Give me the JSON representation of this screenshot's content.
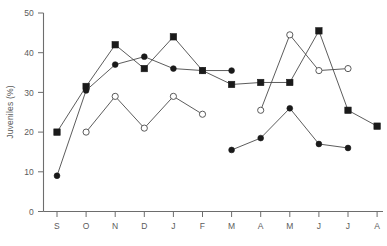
{
  "chart_data": {
    "type": "line",
    "title": "",
    "xlabel": "",
    "ylabel": "Juveniles (%)",
    "categories": [
      "S",
      "O",
      "N",
      "D",
      "J",
      "F",
      "M",
      "A",
      "M",
      "J",
      "J",
      "A"
    ],
    "ylim": [
      0,
      50
    ],
    "yticks": [
      0,
      10,
      20,
      30,
      40,
      50
    ],
    "ytick_labels": [
      "0",
      "10",
      "20",
      "30",
      "40",
      "50"
    ],
    "grid": false,
    "legend": "none",
    "series": [
      {
        "name": "filled-square",
        "marker": "filled square",
        "values": [
          20,
          31.5,
          42,
          36,
          44,
          35.5,
          32,
          32.5,
          32.5,
          45.5,
          25.5,
          21.5
        ]
      },
      {
        "name": "filled-circle",
        "marker": "filled circle",
        "values": [
          9,
          30.5,
          37,
          39,
          36,
          35.5,
          35.5,
          null,
          null,
          null,
          null,
          null
        ]
      },
      {
        "name": "filled-circle-lower",
        "marker": "filled circle",
        "values": [
          null,
          null,
          null,
          null,
          null,
          null,
          15.5,
          18.5,
          26,
          17,
          16,
          null
        ]
      },
      {
        "name": "open-circle",
        "marker": "open circle",
        "values": [
          null,
          20,
          29,
          21,
          29,
          24.5,
          null,
          25.5,
          44.5,
          35.5,
          36,
          null
        ]
      }
    ]
  },
  "axis": {
    "y_title": "Juveniles (%)",
    "y_ticks": [
      "50",
      "40",
      "30",
      "20",
      "10",
      "0"
    ],
    "x_ticks": [
      "S",
      "O",
      "N",
      "D",
      "J",
      "F",
      "M",
      "A",
      "M",
      "J",
      "J",
      "A"
    ]
  }
}
